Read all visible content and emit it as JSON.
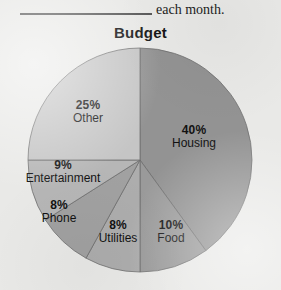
{
  "sentence": {
    "blank_icon": "blank-line-rule",
    "text": "each month."
  },
  "chart_data": {
    "type": "pie",
    "title": "Budget",
    "xlabel": "",
    "ylabel": "",
    "start_angle_deg": 0,
    "direction": "clockwise",
    "legend": "none",
    "grid": false,
    "categories": [
      "Housing",
      "Food",
      "Utilities",
      "Phone",
      "Entertainment",
      "Other"
    ],
    "values": [
      40,
      10,
      8,
      8,
      9,
      25
    ],
    "unit": "%",
    "slices": [
      {
        "category": "Housing",
        "value": 40,
        "pct_label": "40%",
        "color": "#939393"
      },
      {
        "category": "Food",
        "value": 10,
        "pct_label": "10%",
        "color": "#9a9a9a"
      },
      {
        "category": "Utilities",
        "value": 8,
        "pct_label": "8%",
        "color": "#adadad"
      },
      {
        "category": "Phone",
        "value": 8,
        "pct_label": "8%",
        "color": "#a1a1a1"
      },
      {
        "category": "Entertainment",
        "value": 9,
        "pct_label": "9%",
        "color": "#b6b6b6"
      },
      {
        "category": "Other",
        "value": 25,
        "pct_label": "25%",
        "color": "#c5c5c5"
      }
    ]
  },
  "colors": {
    "background": "#e9e9e7",
    "text": "#121212",
    "rule": "#5a5a5a",
    "slice_outline": "#6f6f6f"
  }
}
